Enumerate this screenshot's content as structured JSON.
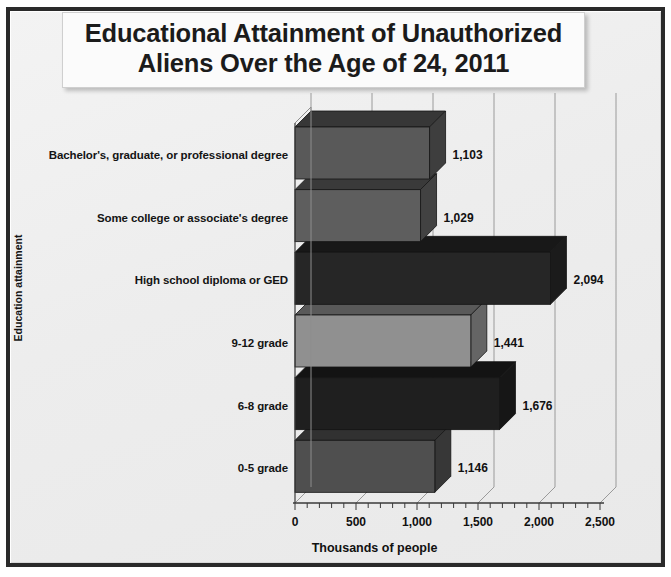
{
  "title": {
    "line1": "Educational Attainment of Unauthorized",
    "line2": "Aliens Over the Age of 24, 2011"
  },
  "chart_data": {
    "type": "bar",
    "orientation": "horizontal",
    "title": "Educational Attainment of Unauthorized Aliens Over the Age of 24, 2011",
    "xlabel": "Thousands of people",
    "ylabel": "Education attainment",
    "categories": [
      "Bachelor's, graduate, or professional degree",
      "Some college or associate's degree",
      "High school diploma or GED",
      "9-12 grade",
      "6-8 grade",
      "0-5 grade"
    ],
    "values": [
      1103,
      1029,
      2094,
      1441,
      1676,
      1146
    ],
    "value_labels": [
      "1,103",
      "1,029",
      "2,094",
      "1,441",
      "1,676",
      "1,146"
    ],
    "bar_colors": [
      "#595959",
      "#5e5e5e",
      "#262626",
      "#909090",
      "#1f1f1f",
      "#4f4f4f"
    ],
    "xlim": [
      0,
      2500
    ],
    "xticks": [
      0,
      500,
      1000,
      1500,
      2000,
      2500
    ],
    "xtick_labels": [
      "0",
      "500",
      "1,000",
      "1,500",
      "2,000",
      "2,500"
    ],
    "minor_ticks_per_interval": 5,
    "grid": true,
    "grid_color": "#9a9a9a",
    "legend": "none",
    "style_3d": true
  },
  "colors": {
    "frame": "#2a2a2a",
    "background": "#eeeeee",
    "title_box": "#fbfbfb",
    "text": "#111111",
    "axis": "#555555"
  }
}
